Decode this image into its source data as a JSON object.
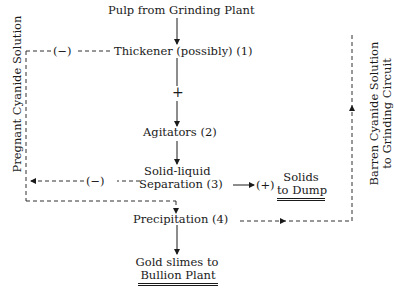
{
  "diagram": {
    "type": "process-flow",
    "nodes": {
      "source": "Pulp from Grinding Plant",
      "thickener": "Thickener (possibly) (1)",
      "agitators": "Agitators (2)",
      "separation_line1": "Solid-liquid",
      "separation_line2": "Separation (3)",
      "precipitation": "Precipitation (4)",
      "solids_line1": "Solids",
      "solids_line2": "to Dump",
      "gold_line1": "Gold slimes to",
      "gold_line2": "Bullion Plant"
    },
    "signs": {
      "thickener_out": "(−)",
      "separation_out": "(−)",
      "solids_out": "(+)",
      "main_flow": "+"
    },
    "side_labels": {
      "left": "Pregnant Cyanide Solution",
      "right_line1": "Barren Cyanide Solution",
      "right_line2": "to Grinding Circuit"
    },
    "edges": [
      {
        "from": "Pulp from Grinding Plant",
        "to": "Thickener (possibly) (1)",
        "style": "solid"
      },
      {
        "from": "Thickener (possibly) (1)",
        "to": "Agitators (2)",
        "style": "solid",
        "label": "+"
      },
      {
        "from": "Agitators (2)",
        "to": "Solid-liquid Separation (3)",
        "style": "solid"
      },
      {
        "from": "Solid-liquid Separation (3)",
        "to": "Solids to Dump",
        "style": "solid",
        "label": "(+)"
      },
      {
        "from": "Thickener (possibly) (1)",
        "to": "Precipitation (4)",
        "style": "dashed",
        "label": "(−)",
        "via": "Pregnant Cyanide Solution"
      },
      {
        "from": "Solid-liquid Separation (3)",
        "to": "Precipitation (4)",
        "style": "dashed",
        "label": "(−)",
        "via": "Pregnant Cyanide Solution"
      },
      {
        "from": "Precipitation (4)",
        "to": "Grinding Circuit",
        "style": "dashed",
        "via": "Barren Cyanide Solution"
      },
      {
        "from": "Precipitation (4)",
        "to": "Gold slimes to Bullion Plant",
        "style": "solid"
      }
    ]
  }
}
